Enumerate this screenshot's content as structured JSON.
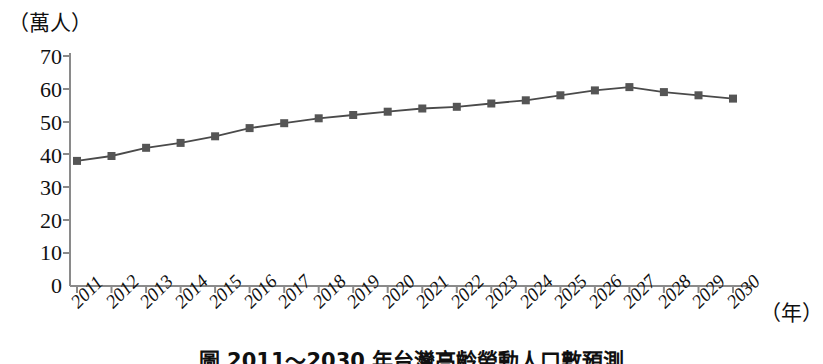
{
  "chart_data": {
    "type": "line",
    "title": "",
    "ylabel": "（萬人）",
    "xlabel": "（年）",
    "categories": [
      "2011",
      "2012",
      "2013",
      "2014",
      "2015",
      "2016",
      "2017",
      "2018",
      "2019",
      "2020",
      "2021",
      "2022",
      "2023",
      "2024",
      "2025",
      "2026",
      "2027",
      "2028",
      "2029",
      "2030"
    ],
    "values": [
      38,
      39.5,
      42,
      43.5,
      45.5,
      48,
      49.5,
      51,
      52,
      53,
      54,
      54.5,
      55.5,
      56.5,
      58,
      59.5,
      60.5,
      59,
      58,
      57
    ],
    "series": [
      {
        "name": "",
        "values": [
          38,
          39.5,
          42,
          43.5,
          45.5,
          48,
          49.5,
          51,
          52,
          53,
          54,
          54.5,
          55.5,
          56.5,
          58,
          59.5,
          60.5,
          59,
          58,
          57
        ]
      }
    ],
    "ylim": [
      0,
      70
    ],
    "yticks": [
      0,
      10,
      20,
      30,
      40,
      50,
      60,
      70
    ],
    "ytick_labels": [
      "0",
      "10",
      "20",
      "30",
      "40",
      "50",
      "60",
      "70"
    ],
    "grid": false,
    "legend": "none",
    "marker": "square",
    "line_color": "#4a4a4a",
    "marker_color": "#555555",
    "axis_color": "#8a8a8a"
  },
  "figure": {
    "caption": "圖 2011～2030 年台灣高齡勞動人口數預測"
  }
}
